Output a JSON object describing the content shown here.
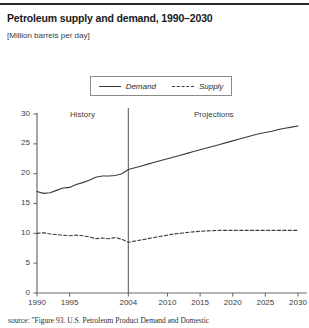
{
  "header": {
    "title": "Petroleum supply and demand, 1990–2030",
    "subtitle": "[Million barrels per day]"
  },
  "source_note": "source: \"Figure 93. U.S. Petroleum Product Demand and Domestic",
  "chart_data": {
    "type": "line",
    "title": "Petroleum supply and demand, 1990–2030",
    "subtitle": "[Million barrels per day]",
    "xlabel": "",
    "ylabel": "Million barrels per day",
    "xlim": [
      1990,
      2031
    ],
    "ylim": [
      0,
      30
    ],
    "ytick_values": [
      0,
      5,
      10,
      15,
      20,
      25,
      30
    ],
    "ytick_labels": [
      "0",
      "5",
      "10",
      "15",
      "20",
      "25",
      "30"
    ],
    "xtick_values": [
      1990,
      1995,
      2004,
      2010,
      2015,
      2020,
      2025,
      2030
    ],
    "xtick_labels": [
      "1990",
      "1995",
      "2004",
      "2010",
      "2015",
      "2020",
      "2025",
      "2030"
    ],
    "grid": false,
    "legend_position": "top-center",
    "legend_entries": [
      "Demand",
      "Supply"
    ],
    "annotations": [
      {
        "text": "History",
        "x": 1995.5,
        "y": 29.2
      },
      {
        "text": "Projections",
        "x": 2016.5,
        "y": 29.2
      }
    ],
    "divider": {
      "x": 2004,
      "label": "history/projections boundary"
    },
    "x": [
      1990,
      1991,
      1992,
      1993,
      1994,
      1995,
      1996,
      1997,
      1998,
      1999,
      2000,
      2001,
      2002,
      2003,
      2004,
      2005,
      2006,
      2007,
      2008,
      2009,
      2010,
      2011,
      2012,
      2013,
      2014,
      2015,
      2016,
      2017,
      2018,
      2019,
      2020,
      2021,
      2022,
      2023,
      2024,
      2025,
      2026,
      2027,
      2028,
      2029,
      2030
    ],
    "series": [
      {
        "name": "Demand",
        "style": "solid",
        "color": "#3a3a3a",
        "values": [
          17.0,
          16.7,
          16.8,
          17.2,
          17.6,
          17.7,
          18.2,
          18.5,
          18.9,
          19.4,
          19.6,
          19.6,
          19.7,
          20.0,
          20.7,
          21.0,
          21.3,
          21.6,
          21.9,
          22.2,
          22.5,
          22.8,
          23.1,
          23.4,
          23.7,
          24.0,
          24.3,
          24.6,
          24.9,
          25.2,
          25.5,
          25.8,
          26.1,
          26.4,
          26.7,
          26.9,
          27.1,
          27.4,
          27.6,
          27.8,
          28.0
        ]
      },
      {
        "name": "Supply",
        "style": "dashed",
        "color": "#3a3a3a",
        "values": [
          10.0,
          10.1,
          9.9,
          9.8,
          9.7,
          9.6,
          9.7,
          9.6,
          9.4,
          9.1,
          9.2,
          9.1,
          9.3,
          9.0,
          8.5,
          8.7,
          8.9,
          9.1,
          9.3,
          9.5,
          9.7,
          9.9,
          10.0,
          10.15,
          10.25,
          10.35,
          10.4,
          10.45,
          10.5,
          10.5,
          10.5,
          10.5,
          10.5,
          10.5,
          10.5,
          10.5,
          10.5,
          10.5,
          10.5,
          10.5,
          10.5
        ]
      }
    ]
  }
}
